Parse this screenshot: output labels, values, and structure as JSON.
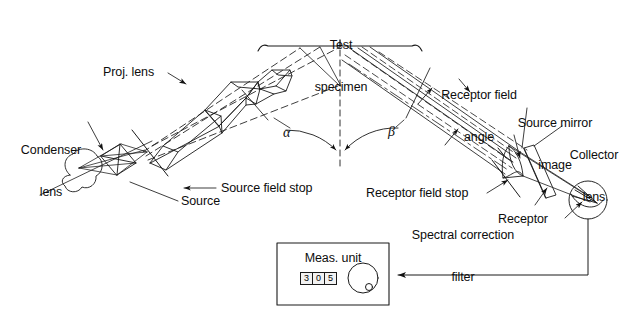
{
  "figure": {
    "background_color": "#ffffff",
    "line_color": "#1a1a1a",
    "text_color": "#0d0d0d"
  },
  "labels": {
    "test_specimen_line1": "Test",
    "test_specimen_line2": "specimen",
    "proj_lens": "Proj. lens",
    "condenser_lens_line1": "Condenser",
    "condenser_lens_line2": "lens",
    "source_field_stop": "Source field stop",
    "source": "Source",
    "receptor_field_angle_line1": "Receptor field",
    "receptor_field_angle_line2": "angle",
    "source_mirror_image_line1": "Source mirror",
    "source_mirror_image_line2": "image",
    "collector_lens_line1": "Collector",
    "collector_lens_line2": "lens",
    "receptor_field_stop": "Receptor field stop",
    "spectral_correction_filter_line1": "Spectral correction",
    "spectral_correction_filter_line2": "filter",
    "receptor": "Receptor",
    "meas_unit": "Meas. unit",
    "angle_alpha": "α",
    "angle_beta": "β"
  },
  "meas_unit": {
    "title": "Meas. unit",
    "display_digits": [
      "3",
      "0",
      "5"
    ],
    "display_value": "305",
    "knob": "rotary-knob"
  },
  "icons": {
    "lamp": "source-lamp-icon",
    "condenser": "condenser-lens-icon",
    "projector": "projector-lens-barrel-icon",
    "collector": "collector-lens-icon",
    "filter": "spectral-filter-plate-icon",
    "receptor": "receptor-detector-icon",
    "knob": "rotary-knob-icon"
  }
}
